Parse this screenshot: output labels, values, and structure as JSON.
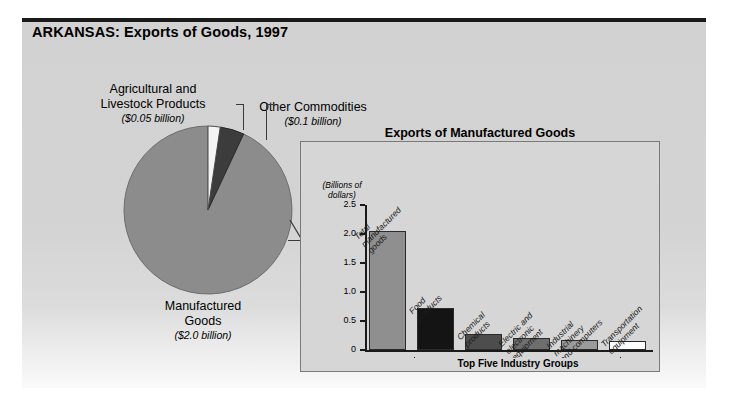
{
  "header": {
    "title": "ARKANSAS: Exports of Goods, 1997"
  },
  "pie": {
    "callouts": [
      {
        "name": "Agricultural and\nLivestock Products",
        "value": "($0.05 billion)"
      },
      {
        "name": "Other Commodities",
        "value": "($0.1 billion)"
      },
      {
        "name": "Manufactured\nGoods",
        "value": "($2.0 billion)"
      }
    ]
  },
  "inset": {
    "title": "Exports of Manufactured Goods",
    "axis_caption": "(Billions of\ndollars)",
    "bracket_label": "Top Five Industry Groups"
  },
  "chart_data": [
    {
      "type": "pie",
      "title": "ARKANSAS: Exports of Goods, 1997",
      "unit": "billions of dollars",
      "categories": [
        "Manufactured Goods",
        "Other Commodities",
        "Agricultural and Livestock Products"
      ],
      "values": [
        2.0,
        0.1,
        0.05
      ],
      "labels": [
        "($2.0 billion)",
        "($0.1 billion)",
        "($0.05 billion)"
      ],
      "colors": [
        "#8c8c8c",
        "#3c3c3c",
        "#f2f2f2"
      ],
      "legend": "callout labels"
    },
    {
      "type": "bar",
      "title": "Exports of Manufactured Goods",
      "ylabel": "(Billions of dollars)",
      "xlabel": "Top Five Industry Groups",
      "categories": [
        "Total manufactured goods",
        "Food products",
        "Chemical products",
        "Electric and electronic equipment",
        "Industrial machinery and computers",
        "Transportation equipment"
      ],
      "category_lines": [
        "Total\nmanufactured\ngoods",
        "Food\nproducts",
        "Chemical\nproducts",
        "Electric and\nelectronic\nequipment",
        "Industrial\nmachinery\nand computers",
        "Transportation\nequipment"
      ],
      "values": [
        2.05,
        0.72,
        0.27,
        0.2,
        0.17,
        0.16
      ],
      "colors": [
        "#8f8f8f",
        "#141414",
        "#4d4d4d",
        "#6e6e6e",
        "#9b9b9b",
        "#ffffff"
      ],
      "ylim": [
        0,
        2.5
      ],
      "yticks": [
        0,
        0.5,
        1.0,
        1.5,
        2.0,
        2.5
      ],
      "ytick_labels": [
        "0",
        "0.5",
        "1.0",
        "1.5",
        "2.0",
        "2.5"
      ],
      "grid": false,
      "legend": "none",
      "bracket_covers": [
        "Food products",
        "Chemical products",
        "Electric and electronic equipment",
        "Industrial machinery and computers",
        "Transportation equipment"
      ]
    }
  ]
}
